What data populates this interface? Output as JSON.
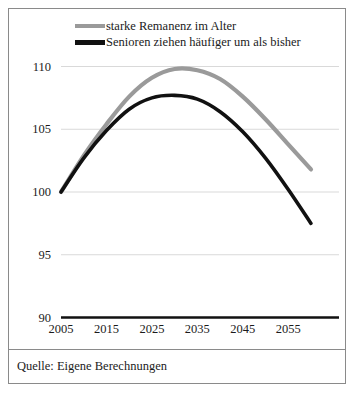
{
  "chart_data": {
    "type": "line",
    "title": "",
    "xlabel": "",
    "ylabel": "",
    "xlim": [
      2005,
      2060
    ],
    "ylim": [
      90,
      112
    ],
    "grid": true,
    "legend_position": "top",
    "y_ticks": [
      "110",
      "105",
      "100",
      "95",
      "90"
    ],
    "y_tick_values": [
      110,
      105,
      100,
      95,
      90
    ],
    "x_ticks": [
      "2005",
      "2015",
      "2025",
      "2035",
      "2045",
      "2055"
    ],
    "x_tick_values": [
      2005,
      2015,
      2025,
      2035,
      2045,
      2055
    ],
    "x": [
      2005,
      2010,
      2015,
      2020,
      2025,
      2030,
      2035,
      2040,
      2045,
      2050,
      2055,
      2060
    ],
    "series": [
      {
        "name": "starke Remanenz im Alter",
        "color": "#9a9a9a",
        "values": [
          100.0,
          102.9,
          105.4,
          107.6,
          109.1,
          109.8,
          109.7,
          109.0,
          107.6,
          105.8,
          103.8,
          101.8
        ]
      },
      {
        "name": "Senioren ziehen häufiger um als bisher",
        "color": "#111111",
        "values": [
          100.0,
          102.7,
          104.9,
          106.6,
          107.5,
          107.7,
          107.4,
          106.4,
          104.8,
          102.7,
          100.2,
          97.5
        ]
      }
    ],
    "baseline": 90,
    "source": "Quelle: Eigene Berechnungen"
  },
  "legend": {
    "items": [
      {
        "label": "starke Remanenz im Alter"
      },
      {
        "label": "Senioren ziehen häufiger um als bisher"
      }
    ]
  },
  "footer": {
    "source": "Quelle: Eigene Berechnungen"
  },
  "colors": {
    "series_gray": "#9a9a9a",
    "series_black": "#111111",
    "grid": "#d9d9d9",
    "border": "#8a8a8a",
    "text": "#1b1b1b"
  }
}
